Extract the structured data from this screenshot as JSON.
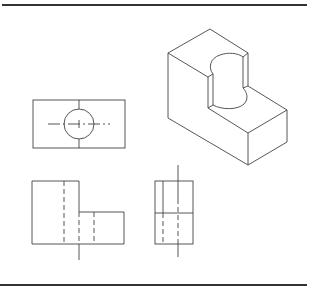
{
  "figure": {
    "type": "technical-drawing",
    "colors": {
      "line": "#444444",
      "rule": "#333333",
      "background": "#ffffff"
    }
  },
  "views": [
    {
      "name": "isometric-view",
      "label": ""
    },
    {
      "name": "top-view",
      "label": ""
    },
    {
      "name": "front-view",
      "label": ""
    },
    {
      "name": "side-view",
      "label": ""
    }
  ]
}
